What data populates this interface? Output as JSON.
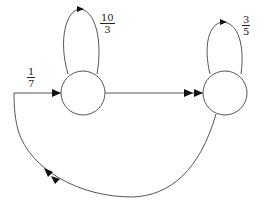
{
  "diagram": {
    "type": "state-transition",
    "nodes": [
      {
        "id": "left-state",
        "cx": 83,
        "cy": 93,
        "r": 22
      },
      {
        "id": "right-state",
        "cx": 225,
        "cy": 93,
        "r": 22
      }
    ],
    "edges": [
      {
        "id": "entry-edge",
        "from": "bottom-arc",
        "to": "left-state",
        "label": {
          "num": "1",
          "den": "7"
        }
      },
      {
        "id": "left-self-loop",
        "from": "left-state",
        "to": "left-state",
        "label": {
          "num": "10",
          "den": "3"
        }
      },
      {
        "id": "right-self-loop",
        "from": "right-state",
        "to": "right-state",
        "label": {
          "num": "3",
          "den": "5"
        }
      },
      {
        "id": "left-to-right",
        "from": "left-state",
        "to": "right-state",
        "arrow": "double"
      },
      {
        "id": "right-to-left-arc",
        "from": "right-state",
        "to": "left-state",
        "arrow": "double"
      }
    ],
    "colors": {
      "line": "#555555",
      "arrowhead": "#111111",
      "background": "#ffffff"
    }
  },
  "labels": {
    "entry": {
      "num": "1",
      "den": "7"
    },
    "left_loop": {
      "num": "10",
      "den": "3"
    },
    "right_loop": {
      "num": "3",
      "den": "5"
    }
  }
}
